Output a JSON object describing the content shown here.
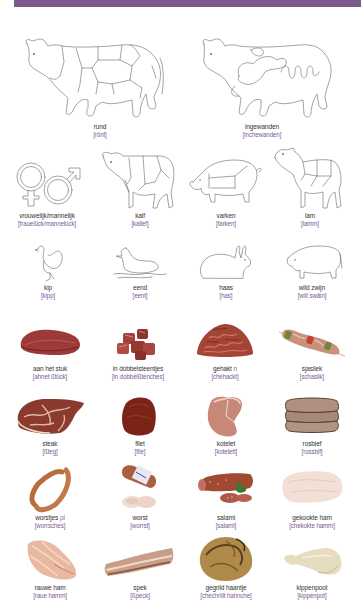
{
  "header": {
    "band_color": "#7d5a8c"
  },
  "colors": {
    "label": "#333333",
    "pronunciation": "#7a5a96",
    "line_art": "#666666"
  },
  "sections": {
    "animals_large": [
      {
        "id": "rund",
        "label": "rund",
        "pron": "[rönt]",
        "icon": "cow-cuts-icon"
      },
      {
        "id": "ingewanden",
        "label": "ingewanden",
        "pron": "[inchewanden]",
        "icon": "cow-organs-icon"
      }
    ],
    "animals_small": [
      {
        "id": "vrouwelijk",
        "label": "vrouwelijk/mannelijk",
        "pron": "[frauelück/mannelück]",
        "icon": "gender-symbols-icon"
      },
      {
        "id": "kalf",
        "label": "kalf",
        "pron": "[kallef]",
        "icon": "calf-icon"
      },
      {
        "id": "varken",
        "label": "varken",
        "pron": "[farken]",
        "icon": "pig-icon"
      },
      {
        "id": "lam",
        "label": "lam",
        "pron": "[lamm]",
        "icon": "lamb-icon"
      }
    ],
    "animals_game": [
      {
        "id": "kip",
        "label": "kip",
        "pron": "[kipp]",
        "icon": "chicken-icon"
      },
      {
        "id": "eend",
        "label": "eend",
        "pron": "[eent]",
        "icon": "duck-icon"
      },
      {
        "id": "haas",
        "label": "haas",
        "pron": "[has]",
        "icon": "hare-icon"
      },
      {
        "id": "wild_zwijn",
        "label": "wild zwijn",
        "pron": "[wilt swäin]",
        "icon": "wild-boar-icon"
      }
    ],
    "meat_row1": [
      {
        "id": "aan_het_stuk",
        "label": "aan het stuk",
        "gram": "",
        "pron": "[ahnet ßtück]",
        "icon": "meat-piece-icon"
      },
      {
        "id": "dobbelsteentjes",
        "label": "in dobbelsteentjes",
        "gram": "",
        "pron": "[in dobbelßtenches]",
        "icon": "meat-cubes-icon"
      },
      {
        "id": "gehakt",
        "label": "gehakt",
        "gram": "n",
        "pron": "[chehackt]",
        "icon": "minced-meat-icon"
      },
      {
        "id": "sjasliek",
        "label": "sjasliek",
        "gram": "",
        "pron": "[schaslik]",
        "icon": "skewer-icon"
      }
    ],
    "meat_row2": [
      {
        "id": "steak",
        "label": "steak",
        "gram": "",
        "pron": "[ßteg]",
        "icon": "steak-icon"
      },
      {
        "id": "filet",
        "label": "filet",
        "gram": "",
        "pron": "[file]",
        "icon": "filet-icon"
      },
      {
        "id": "kotelet",
        "label": "kotelet",
        "gram": "",
        "pron": "[kotelett]",
        "icon": "cutlet-icon"
      },
      {
        "id": "rosbief",
        "label": "rosbief",
        "gram": "",
        "pron": "[rossbif]",
        "icon": "roastbeef-icon"
      }
    ],
    "meat_row3": [
      {
        "id": "worstjes",
        "label": "worstjes",
        "gram": "pl",
        "pron": "[worrsches]",
        "icon": "sausages-icon"
      },
      {
        "id": "worst",
        "label": "worst",
        "gram": "",
        "pron": "[worrst]",
        "icon": "sausage-icon"
      },
      {
        "id": "salami",
        "label": "salami",
        "gram": "",
        "pron": "[salami]",
        "icon": "salami-icon"
      },
      {
        "id": "gekookte_ham",
        "label": "gekookte ham",
        "gram": "",
        "pron": "[chekokte hamm]",
        "icon": "cooked-ham-icon"
      }
    ],
    "meat_row4": [
      {
        "id": "rauwe_ham",
        "label": "rauwe ham",
        "gram": "",
        "pron": "[raue hamm]",
        "icon": "raw-ham-icon"
      },
      {
        "id": "spek",
        "label": "spek",
        "gram": "",
        "pron": "[ßpeck]",
        "icon": "bacon-icon"
      },
      {
        "id": "gegrild_haantje",
        "label": "gegrild haantje",
        "gram": "",
        "pron": "[chechrillt hahnche]",
        "icon": "grilled-chicken-icon"
      },
      {
        "id": "kippenpoot",
        "label": "kippenpoot",
        "gram": "",
        "pron": "[kippenpot]",
        "icon": "chicken-leg-icon"
      }
    ]
  }
}
